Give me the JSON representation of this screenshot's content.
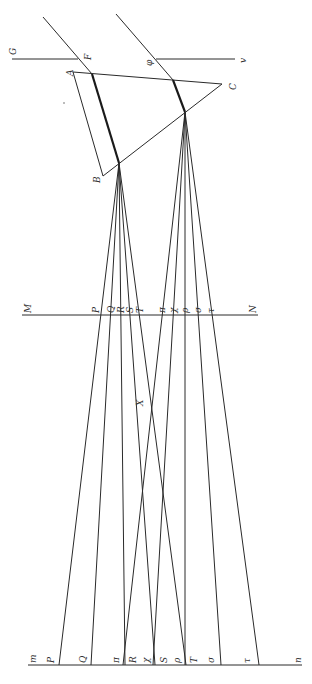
{
  "figure": {
    "colors": {
      "ink": "#2a2a2a",
      "background": "#ffffff"
    }
  },
  "labels": {
    "G": "G",
    "F": "F",
    "phi": "φ",
    "v": "v",
    "A": "A",
    "B": "B",
    "C": "C",
    "M": "M",
    "N": "N",
    "X": "X",
    "m": "m",
    "n": "n"
  },
  "mn_line_labels_upper": [
    "P",
    "Q",
    "R",
    "S",
    "T",
    "π",
    "χ",
    "ρ",
    "σ",
    "τ"
  ],
  "bottom_line_labels": [
    "P",
    "Q",
    "π",
    "R",
    "χ",
    "S",
    "ρ",
    "T",
    "σ",
    "τ"
  ]
}
